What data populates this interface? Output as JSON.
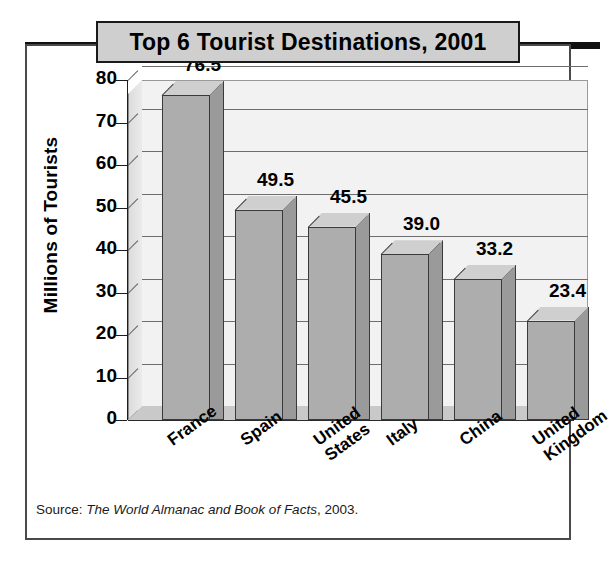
{
  "chart_data": {
    "type": "bar",
    "title": "Top 6 Tourist Destinations, 2001",
    "xlabel": "",
    "ylabel": "Millions of Tourists",
    "categories": [
      "France",
      "Spain",
      "United States",
      "Italy",
      "China",
      "United Kingdom"
    ],
    "category_lines": [
      [
        "France"
      ],
      [
        "Spain"
      ],
      [
        "United",
        "States"
      ],
      [
        "Italy"
      ],
      [
        "China"
      ],
      [
        "United",
        "Kingdom"
      ]
    ],
    "values": [
      76.5,
      49.5,
      45.5,
      39.0,
      33.2,
      23.4
    ],
    "value_labels": [
      "76.5",
      "49.5",
      "45.5",
      "39.0",
      "33.2",
      "23.4"
    ],
    "ylim": [
      0,
      80
    ],
    "yticks": [
      0,
      10,
      20,
      30,
      40,
      50,
      60,
      70,
      80
    ],
    "ytick_labels": [
      "0",
      "10",
      "20",
      "30",
      "40",
      "50",
      "60",
      "70",
      "80"
    ],
    "grid": "horizontal",
    "legend": "none",
    "style": "3d-column",
    "colors": {
      "bar_front": "#adadad",
      "bar_side": "#9a9a9a",
      "bar_top": "#cfcfcf",
      "plot_background": "#f2f2f2",
      "gridline": "#6e6e6e",
      "axis": "#1d1d1d",
      "title_banner": "#cfcfcf",
      "frame": "#4a4a4a",
      "text": "#000000"
    }
  },
  "source": {
    "prefix": "Source: ",
    "publication": "The World Almanac and Book of Facts",
    "suffix": ", 2003."
  }
}
